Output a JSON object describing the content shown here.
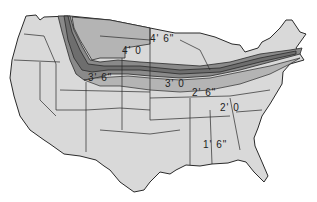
{
  "map": {
    "subject": "Frost line depth map of the contiguous United States",
    "colors": {
      "background": "#ffffff",
      "land_light": "#d9d9d9",
      "band_mid": "#b4b4b4",
      "band_dark": "#8a8a8a",
      "band_darkest": "#6e6e6e",
      "border": "#2a2a2a"
    },
    "labels": [
      {
        "id": "depth-4-6",
        "text": "4' 6\"",
        "x": 150,
        "y": 34
      },
      {
        "id": "depth-4-0",
        "text": "4' 0",
        "x": 122,
        "y": 46
      },
      {
        "id": "depth-3-6",
        "text": "3' 6\"",
        "x": 88,
        "y": 73
      },
      {
        "id": "depth-3-0",
        "text": "3' 0",
        "x": 165,
        "y": 79
      },
      {
        "id": "depth-2-6",
        "text": "2' 6\"",
        "x": 192,
        "y": 88
      },
      {
        "id": "depth-2-0",
        "text": "2' 0",
        "x": 220,
        "y": 103
      },
      {
        "id": "depth-1-6",
        "text": "1' 6\"",
        "x": 203,
        "y": 140
      }
    ]
  }
}
